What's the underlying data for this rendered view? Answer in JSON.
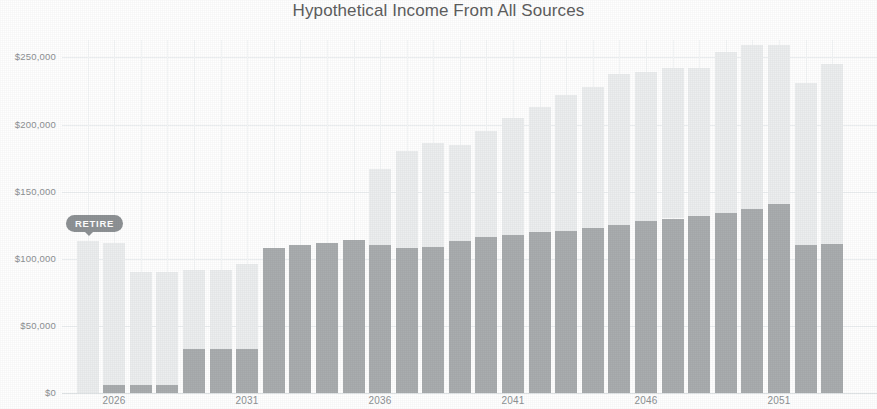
{
  "chart_data": {
    "type": "bar",
    "title": "Hypothetical Income From All Sources",
    "subtitle": "",
    "xlabel": "",
    "ylabel": "",
    "stacked": true,
    "grid": true,
    "legend_position": "none",
    "ylim": [
      0,
      263000
    ],
    "yticks": [
      0,
      50000,
      100000,
      150000,
      200000,
      250000
    ],
    "ytick_labels": [
      "$0",
      "$50,000",
      "$100,000",
      "$150,000",
      "$200,000",
      "$250,000"
    ],
    "xtick_labels": [
      "2026",
      "2031",
      "2036",
      "2041",
      "2046",
      "2051"
    ],
    "categories": [
      "2025",
      "2026",
      "2027",
      "2028",
      "2029",
      "2030",
      "2031",
      "2032",
      "2033",
      "2034",
      "2035",
      "2036",
      "2037",
      "2038",
      "2039",
      "2040",
      "2041",
      "2042",
      "2043",
      "2044",
      "2045",
      "2046",
      "2047",
      "2048",
      "2049",
      "2050",
      "2051",
      "2052",
      "2053"
    ],
    "series": [
      {
        "name": "Portfolio & Other Income",
        "color": "#a9adaf",
        "values": [
          0,
          6000,
          6000,
          6000,
          33000,
          33000,
          33000,
          108000,
          110000,
          112000,
          114000,
          110000,
          108000,
          109000,
          113000,
          116000,
          118000,
          120000,
          121000,
          123000,
          125000,
          128000,
          130000,
          132000,
          134000,
          137000,
          141000,
          110000,
          111000
        ]
      },
      {
        "name": "Social Security & Pension",
        "color": "#eceeef",
        "values": [
          113000,
          106000,
          84000,
          84000,
          59000,
          59000,
          63000,
          0,
          0,
          0,
          0,
          57000,
          72000,
          77000,
          72000,
          79000,
          87000,
          93000,
          101000,
          105000,
          113000,
          111000,
          112000,
          110000,
          120000,
          122000,
          118000,
          121000,
          134000
        ]
      }
    ],
    "annotations": [
      {
        "label": "RETIRE",
        "at_category": "2025",
        "kind": "pill-marker"
      }
    ]
  },
  "axis": {
    "y": [
      {
        "label": "$250,000",
        "value": 250000
      },
      {
        "label": "$200,000",
        "value": 200000
      },
      {
        "label": "$150,000",
        "value": 150000
      },
      {
        "label": "$100,000",
        "value": 100000
      },
      {
        "label": "$50,000",
        "value": 50000
      },
      {
        "label": "$0",
        "value": 0
      }
    ],
    "x": [
      {
        "label": "2026",
        "value": 2026
      },
      {
        "label": "2031",
        "value": 2031
      },
      {
        "label": "2036",
        "value": 2036
      },
      {
        "label": "2041",
        "value": 2041
      },
      {
        "label": "2046",
        "value": 2046
      },
      {
        "label": "2051",
        "value": 2051
      }
    ]
  },
  "marker": {
    "retire_label": "RETIRE"
  },
  "colors": {
    "lower_series": "#a9adaf",
    "upper_series": "#eceeef",
    "grid": "#eceff1",
    "text": "#8d9194",
    "title": "#5e5e5e",
    "marker_bg": "#8e9295",
    "marker_text": "#ffffff"
  }
}
